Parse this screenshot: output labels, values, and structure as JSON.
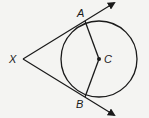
{
  "diagram": {
    "type": "geometry-tangents-to-circle",
    "stroke_color": "#1a1a1a",
    "background": "#f4f4f2",
    "circle": {
      "center_label": "C",
      "cx": 99,
      "cy": 59,
      "r": 38
    },
    "points": {
      "X": {
        "label": "X",
        "x": 23,
        "y": 59
      },
      "A": {
        "label": "A",
        "x": 85,
        "y": 21
      },
      "B": {
        "label": "B",
        "x": 85,
        "y": 97
      },
      "C": {
        "label": "C",
        "x": 99,
        "y": 59
      }
    },
    "rays": [
      {
        "from": "X",
        "through": "A",
        "end": [
          116,
          2
        ]
      },
      {
        "from": "X",
        "through": "B",
        "end": [
          116,
          116
        ]
      }
    ],
    "segments": [
      {
        "from": "C",
        "to": "A"
      },
      {
        "from": "C",
        "to": "B"
      }
    ],
    "labels": {
      "X": "X",
      "A": "A",
      "B": "B",
      "C": "C"
    }
  }
}
